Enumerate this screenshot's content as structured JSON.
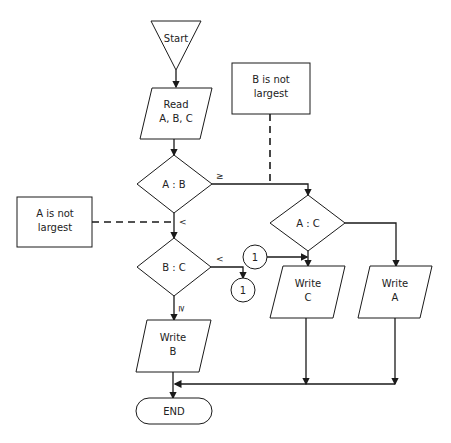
{
  "flowchart": {
    "start": {
      "label": "Start"
    },
    "read": {
      "line1": "Read",
      "line2": "A, B, C"
    },
    "decision_ab": {
      "label": "A : B",
      "yes_label": "≥",
      "no_label": "<"
    },
    "decision_bc": {
      "label": "B : C",
      "yes_label": "<",
      "no_label": "≥"
    },
    "decision_ac": {
      "label": "A : C"
    },
    "note_b": {
      "line1": "B is not",
      "line2": "largest"
    },
    "note_a": {
      "line1": "A is not",
      "line2": "largest"
    },
    "connector_out": {
      "label": "1"
    },
    "connector_in": {
      "label": "1"
    },
    "write_b": {
      "line1": "Write",
      "line2": "B"
    },
    "write_c": {
      "line1": "Write",
      "line2": "C"
    },
    "write_a": {
      "line1": "Write",
      "line2": "A"
    },
    "end": {
      "label": "END"
    }
  }
}
